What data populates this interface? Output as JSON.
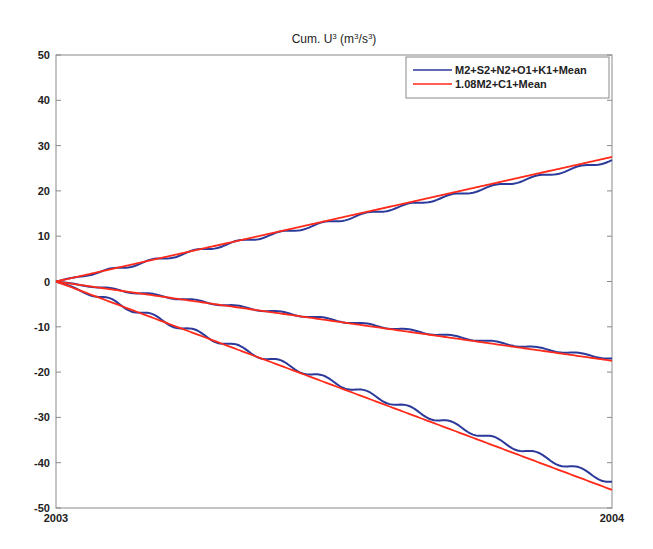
{
  "chart_data": {
    "type": "line",
    "title_parts": {
      "prefix": "Cum. U",
      "sup1": "3",
      "mid": " (m",
      "sup2": "3",
      "mid2": "/s",
      "sup3": "3",
      "suffix": ")"
    },
    "xlabel": "",
    "ylabel": "",
    "xlim": [
      2003,
      2004
    ],
    "ylim": [
      -50,
      50
    ],
    "x_ticks": [
      {
        "value": 2003,
        "label": "2003"
      },
      {
        "value": 2004,
        "label": "2004"
      }
    ],
    "y_ticks": [
      50,
      40,
      30,
      20,
      10,
      0,
      -10,
      -20,
      -30,
      -40,
      -50
    ],
    "grid": false,
    "legend_position": "upper right",
    "x": [
      0,
      0.1,
      0.2,
      0.3,
      0.4,
      0.5,
      0.6,
      0.7,
      0.8,
      0.9,
      1.0
    ],
    "series": [
      {
        "name": "M2+S2+N2+O1+K1+Mean",
        "color": "#2b3a9a",
        "group": "upper",
        "values": [
          0,
          2.6,
          5.3,
          8.0,
          10.6,
          13.3,
          16.0,
          18.6,
          21.3,
          24.0,
          26.8
        ]
      },
      {
        "name": "1.08M2+C1+Mean",
        "color": "#ff2a1a",
        "group": "upper",
        "values": [
          0,
          2.75,
          5.5,
          8.25,
          11.0,
          13.75,
          16.5,
          19.25,
          22.0,
          24.75,
          27.5
        ]
      },
      {
        "name": "M2+S2+N2+O1+K1+Mean",
        "color": "#2b3a9a",
        "group": "middle",
        "values": [
          0,
          -1.7,
          -3.4,
          -5.1,
          -6.8,
          -8.5,
          -10.2,
          -11.9,
          -13.6,
          -15.3,
          -17.0
        ]
      },
      {
        "name": "1.08M2+C1+Mean",
        "color": "#ff2a1a",
        "group": "middle",
        "values": [
          0,
          -1.75,
          -3.5,
          -5.25,
          -7.0,
          -8.75,
          -10.5,
          -12.25,
          -14.0,
          -15.75,
          -17.5
        ]
      },
      {
        "name": "M2+S2+N2+O1+K1+Mean",
        "color": "#2b3a9a",
        "group": "lower",
        "values": [
          0,
          -4.4,
          -9.0,
          -13.4,
          -17.8,
          -22.2,
          -26.5,
          -31.0,
          -35.4,
          -39.8,
          -44.2
        ]
      },
      {
        "name": "1.08M2+C1+Mean",
        "color": "#ff2a1a",
        "group": "lower",
        "values": [
          0,
          -4.6,
          -9.2,
          -13.8,
          -18.4,
          -23.0,
          -27.6,
          -32.2,
          -36.8,
          -41.4,
          -46.0
        ]
      }
    ],
    "legend": [
      {
        "label": "M2+S2+N2+O1+K1+Mean",
        "color": "#2b3a9a"
      },
      {
        "label": "1.08M2+C1+Mean",
        "color": "#ff2a1a"
      }
    ]
  }
}
